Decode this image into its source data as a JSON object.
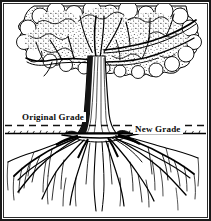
{
  "figure": {
    "kind": "line-art-illustration",
    "width": 211,
    "height": 221,
    "background_color": "#ffffff",
    "ink_color": "#000000",
    "frame": {
      "outer_border_color": "#1a1a1a",
      "inner_border_color": "#2b2b2b",
      "style": "double-rule-rectangle"
    }
  },
  "labels": {
    "original_grade": "Original Grade",
    "new_grade": "New Grade"
  },
  "grade_lines": {
    "original_grade": {
      "style": "dashed",
      "y": 125,
      "color": "#111111",
      "label": "Original Grade"
    },
    "new_grade": {
      "style": "solid-textured-soil",
      "y": 133,
      "color": "#000000",
      "label": "New Grade"
    }
  },
  "scene": {
    "canopy": {
      "name": "tree-canopy",
      "description": "dense stippled deciduous foliage filling upper two-thirds",
      "fill": "#ffffff",
      "outline": "#000000"
    },
    "trunk": {
      "name": "tree-trunk",
      "description": "vertical trunk with bark striations, dark shading on left side, flared base at soil line"
    },
    "branches": {
      "name": "tree-branches",
      "description": "limbs radiating left and right from upper trunk into the canopy"
    },
    "roots": {
      "name": "root-system",
      "description": "wide lateral roots below soil line tapering into fine descending rootlets"
    },
    "soil_zone": {
      "name": "soil-zone",
      "description": "area below the new grade line containing the root system"
    }
  },
  "icons": {
    "dashed_rule": "dashed-line-icon",
    "soil_rule": "soil-line-icon"
  }
}
